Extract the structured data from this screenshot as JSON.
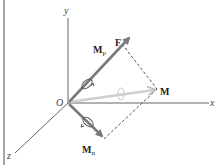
{
  "diagram": {
    "axes": {
      "x_label": "x",
      "y_label": "y",
      "z_label": "z",
      "origin_label": "O"
    },
    "vectors": {
      "force_label": "F",
      "moment_label": "M",
      "parallel_moment_label": "M",
      "parallel_moment_sub": "p",
      "normal_moment_label": "M",
      "normal_moment_sub": "n"
    },
    "colors": {
      "axis": "#555555",
      "vector_dark": "#7a7a7a",
      "vector_light": "#cfcfcf",
      "dashed": "#444444",
      "border": "#888888",
      "text": "#222222"
    }
  }
}
